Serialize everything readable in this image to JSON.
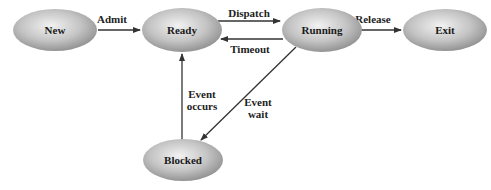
{
  "diagram": {
    "type": "state-transition",
    "nodes": [
      {
        "id": "new",
        "label": "New"
      },
      {
        "id": "ready",
        "label": "Ready"
      },
      {
        "id": "running",
        "label": "Running"
      },
      {
        "id": "exit",
        "label": "Exit"
      },
      {
        "id": "blocked",
        "label": "Blocked"
      }
    ],
    "edges": [
      {
        "id": "admit",
        "from": "new",
        "to": "ready",
        "label": "Admit"
      },
      {
        "id": "dispatch",
        "from": "ready",
        "to": "running",
        "label": "Dispatch"
      },
      {
        "id": "timeout",
        "from": "running",
        "to": "ready",
        "label": "Timeout"
      },
      {
        "id": "release",
        "from": "running",
        "to": "exit",
        "label": "Release"
      },
      {
        "id": "event-wait",
        "from": "running",
        "to": "blocked",
        "label_lines": [
          "Event",
          "wait"
        ]
      },
      {
        "id": "event-occurs",
        "from": "blocked",
        "to": "ready",
        "label_lines": [
          "Event",
          "occurs"
        ]
      }
    ],
    "colors": {
      "node_light": "#f2f2f2",
      "node_dark": "#8a8a8a",
      "edge": "#333333",
      "text": "#1a1a1a"
    }
  }
}
